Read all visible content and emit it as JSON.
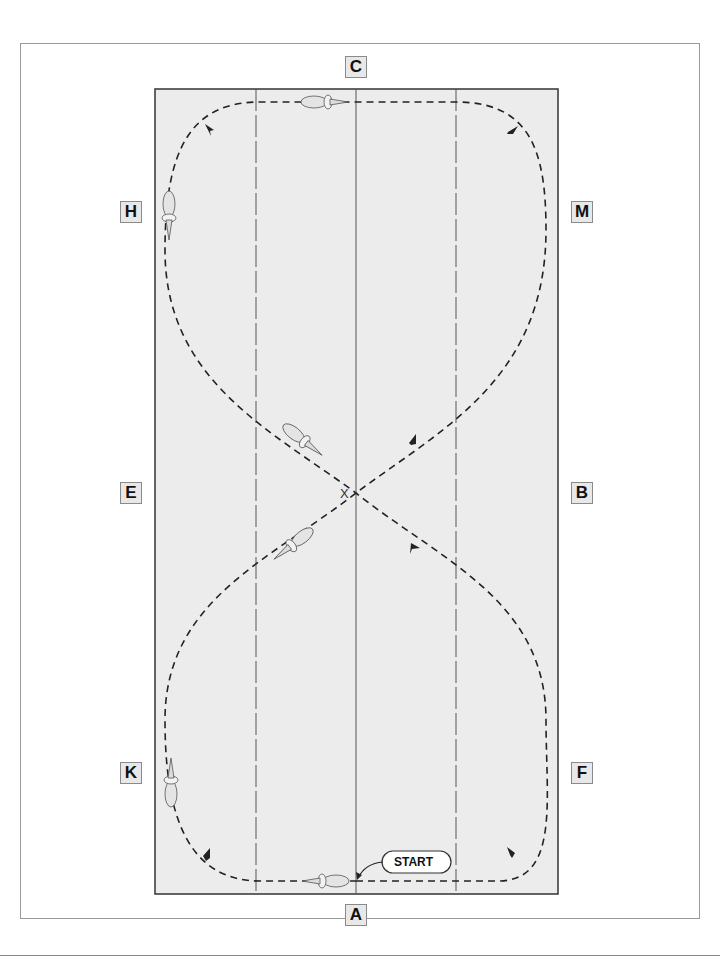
{
  "diagram": {
    "title": "",
    "type": "dressage arena figure-eight pattern",
    "markers": {
      "top": "C",
      "bottom": "A",
      "left": [
        "H",
        "E",
        "K"
      ],
      "right": [
        "M",
        "B",
        "F"
      ]
    },
    "center_label": "X",
    "start_label": "START",
    "colors": {
      "arena_fill": "#ececec",
      "border": "#333333",
      "path": "#222222",
      "marker_fill": "#e8e8e8"
    },
    "path_style": "dashed with direction arrows",
    "horses_count": 6
  }
}
